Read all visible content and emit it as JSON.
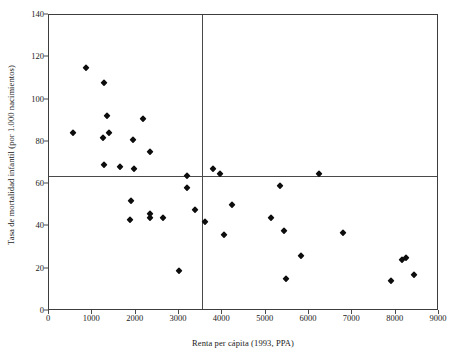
{
  "chart_data": {
    "type": "scatter",
    "title": "",
    "xlabel": "Renta per cápita (1993, PPA)",
    "ylabel": "Tasa de mortalidad infantil (por 1.000 nacimientos)",
    "xlim": [
      0,
      9000
    ],
    "ylim": [
      0,
      140
    ],
    "xticks": [
      0,
      1000,
      2000,
      3000,
      4000,
      5000,
      6000,
      7000,
      8000,
      9000
    ],
    "yticks": [
      0,
      20,
      40,
      60,
      80,
      100,
      120,
      140
    ],
    "xtick_labels": [
      "0",
      "1000",
      "2000",
      "3000",
      "4000",
      "5000",
      "6000",
      "7000",
      "8000",
      "9000"
    ],
    "ytick_labels": [
      "0",
      "20",
      "40",
      "60",
      "80",
      "100",
      "120",
      "140"
    ],
    "grid": false,
    "legend": null,
    "marker": "diamond",
    "marker_color": "#0d0d0d",
    "reference_lines": [
      {
        "orientation": "horizontal",
        "value": 64,
        "label": "media mortalidad"
      },
      {
        "orientation": "vertical",
        "value": 3530,
        "label": "media renta"
      }
    ],
    "points": [
      {
        "x": 550,
        "y": 84
      },
      {
        "x": 860,
        "y": 115
      },
      {
        "x": 1260,
        "y": 108
      },
      {
        "x": 1250,
        "y": 82
      },
      {
        "x": 1340,
        "y": 92
      },
      {
        "x": 1380,
        "y": 84
      },
      {
        "x": 1270,
        "y": 69
      },
      {
        "x": 1640,
        "y": 68
      },
      {
        "x": 1940,
        "y": 81
      },
      {
        "x": 1960,
        "y": 67
      },
      {
        "x": 2180,
        "y": 91
      },
      {
        "x": 2330,
        "y": 75
      },
      {
        "x": 1900,
        "y": 52
      },
      {
        "x": 1880,
        "y": 43
      },
      {
        "x": 2330,
        "y": 46
      },
      {
        "x": 2320,
        "y": 44
      },
      {
        "x": 2640,
        "y": 44
      },
      {
        "x": 2990,
        "y": 19
      },
      {
        "x": 3180,
        "y": 64
      },
      {
        "x": 3180,
        "y": 58
      },
      {
        "x": 3370,
        "y": 48
      },
      {
        "x": 3610,
        "y": 42
      },
      {
        "x": 3780,
        "y": 67
      },
      {
        "x": 3940,
        "y": 65
      },
      {
        "x": 4040,
        "y": 36
      },
      {
        "x": 4230,
        "y": 50
      },
      {
        "x": 5130,
        "y": 44
      },
      {
        "x": 5330,
        "y": 59
      },
      {
        "x": 5420,
        "y": 38
      },
      {
        "x": 5480,
        "y": 15
      },
      {
        "x": 5810,
        "y": 26
      },
      {
        "x": 6230,
        "y": 65
      },
      {
        "x": 6780,
        "y": 37
      },
      {
        "x": 7900,
        "y": 14
      },
      {
        "x": 8140,
        "y": 24
      },
      {
        "x": 8240,
        "y": 25
      },
      {
        "x": 8420,
        "y": 17
      }
    ]
  }
}
